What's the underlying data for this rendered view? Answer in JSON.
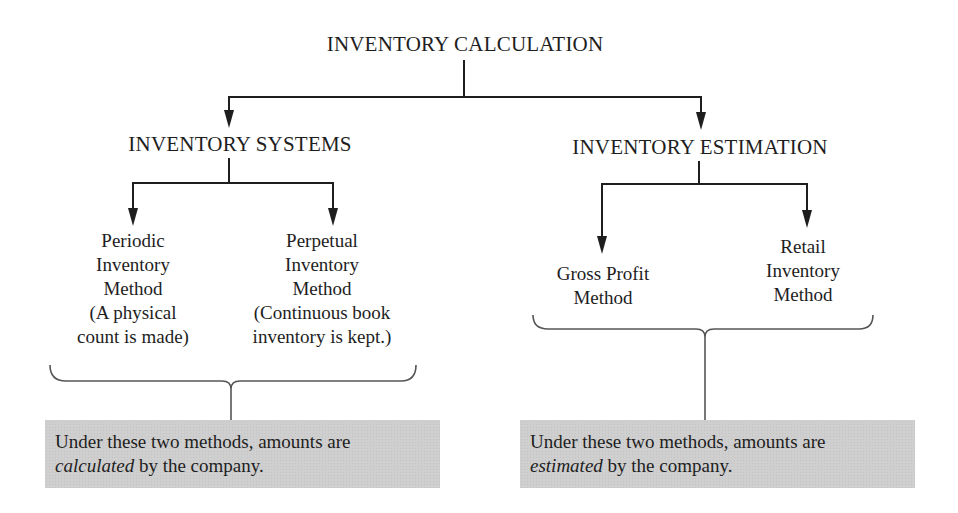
{
  "diagram": {
    "root": {
      "label": "INVENTORY CALCULATION"
    },
    "branches": [
      {
        "label": "INVENTORY SYSTEMS",
        "children": [
          {
            "lines": [
              "Periodic",
              "Inventory",
              "Method",
              "(A physical",
              "count is made)"
            ]
          },
          {
            "lines": [
              "Perpetual",
              "Inventory",
              "Method",
              "(Continuous book",
              "inventory is kept.)"
            ]
          }
        ],
        "note": {
          "prefix": "Under these two methods, amounts are",
          "emphasis": "calculated",
          "suffix": " by the company."
        }
      },
      {
        "label": "INVENTORY ESTIMATION",
        "children": [
          {
            "lines": [
              "Gross Profit",
              "Method"
            ]
          },
          {
            "lines": [
              "Retail",
              "Inventory",
              "Method"
            ]
          }
        ],
        "note": {
          "prefix": "Under these two methods, amounts are",
          "emphasis": "estimated",
          "suffix": " by the company."
        }
      }
    ],
    "colors": {
      "line": "#1e1e1e",
      "note_background": "#cfcfcf",
      "brace": "#555555"
    }
  }
}
